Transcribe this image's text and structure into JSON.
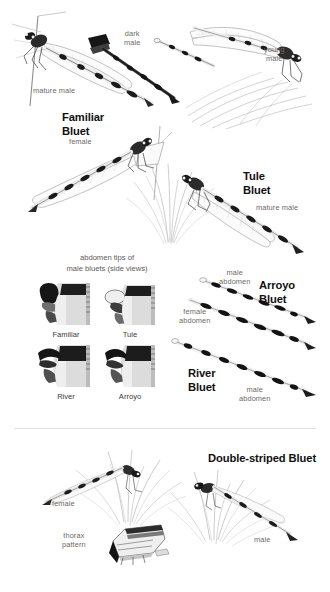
{
  "plate": {
    "title": "Bluet Damselflies (Enallagma) plate",
    "background_color": "#ffffff",
    "label_color": "#6e6a66",
    "heading_color": "#101010"
  },
  "sections": {
    "familiar": {
      "species_name": "Familiar\nBluet",
      "labels": {
        "mature_male": "mature male",
        "dark_male": "dark\nmale",
        "young_male": "young\nmale",
        "female": "female"
      }
    },
    "tule": {
      "species_name": "Tule\nBluet",
      "labels": {
        "mature_male": "mature male"
      }
    },
    "abdomen_tips": {
      "caption": "abdomen tips of\nmale bluets (side views)",
      "tips": [
        {
          "name": "Familiar"
        },
        {
          "name": "Tule"
        },
        {
          "name": "River"
        },
        {
          "name": "Arroyo"
        }
      ]
    },
    "arroyo": {
      "species_name": "Arroyo\nBluet",
      "labels": {
        "male_abdomen": "male\nabdomen",
        "female_abdomen": "female\nabdomen"
      }
    },
    "river": {
      "species_name": "River\nBluet",
      "labels": {
        "male_abdomen": "male\nabdomen"
      }
    },
    "double_striped": {
      "species_name": "Double-striped Bluet",
      "labels": {
        "female": "female",
        "male": "male",
        "thorax_pattern": "thorax\npattern"
      }
    }
  }
}
